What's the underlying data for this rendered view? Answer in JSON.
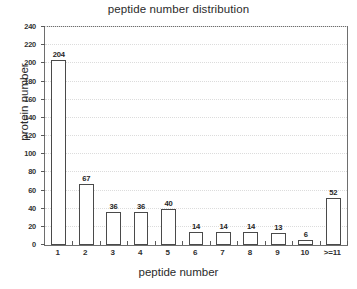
{
  "chart_data": {
    "type": "bar",
    "title": "peptide number distribution",
    "xlabel": "peptide number",
    "ylabel": "protein number",
    "categories": [
      "1",
      "2",
      "3",
      "4",
      "5",
      "6",
      "7",
      "8",
      "9",
      "10",
      ">=11"
    ],
    "values": [
      204,
      67,
      36,
      36,
      40,
      14,
      14,
      14,
      13,
      6,
      52
    ],
    "value_labels": [
      "204",
      "67",
      "36",
      "36",
      "40",
      "14",
      "14",
      "14",
      "13",
      "6",
      "52"
    ],
    "ylim": [
      0,
      240
    ],
    "ytick_labels": [
      "0",
      "20",
      "40",
      "60",
      "80",
      "100",
      "120",
      "140",
      "160",
      "180",
      "200",
      "220",
      "240"
    ],
    "ytick_values": [
      0,
      20,
      40,
      60,
      80,
      100,
      120,
      140,
      160,
      180,
      200,
      220,
      240
    ],
    "grid": true,
    "grid_axis": "y",
    "legend": false,
    "bar_fill_color": "#ffffff",
    "bar_edge_color": "#4a4a4a",
    "axis_color": "#6e6e6e",
    "grid_color": "#dcdcdc",
    "text_color": "#2b2b2b"
  }
}
